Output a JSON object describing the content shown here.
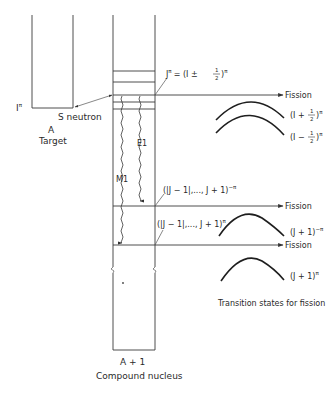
{
  "figure": {
    "target": {
      "label_A": "A",
      "label_name": "Target",
      "spin_label": "I",
      "spin_sup": "π"
    },
    "incident": {
      "label": "S neutron"
    },
    "compound": {
      "label_A": "A + 1",
      "label_name": "Compound nucleus"
    },
    "levels": {
      "capture_state": {
        "J": "J",
        "sup": "π",
        "eq": "= (I ±",
        "frac_num": "1",
        "frac_den": "2",
        "close": ")",
        "close_sup": "π"
      },
      "level_E1": {
        "text": "(|J − 1|,..., J + 1)",
        "sup": "−π"
      },
      "level_M1": {
        "text": "(|J − 1|,..., J + 1)",
        "sup": "π"
      }
    },
    "transitions": {
      "E1": "E1",
      "M1": "M1"
    },
    "fission_arrows": [
      "Fission",
      "Fission",
      "Fission"
    ],
    "barriers": {
      "upper_plus": {
        "open": "(I +",
        "num": "1",
        "den": "2",
        "close": ")",
        "sup": "π"
      },
      "upper_minus": {
        "open": "(I −",
        "num": "1",
        "den": "2",
        "close": ")",
        "sup": "π"
      },
      "middle": {
        "text": "(J + 1)",
        "sup": "−π"
      },
      "lower": {
        "text": "(J + 1)",
        "sup": "π"
      }
    },
    "caption_transition": "Transition states for fission"
  }
}
